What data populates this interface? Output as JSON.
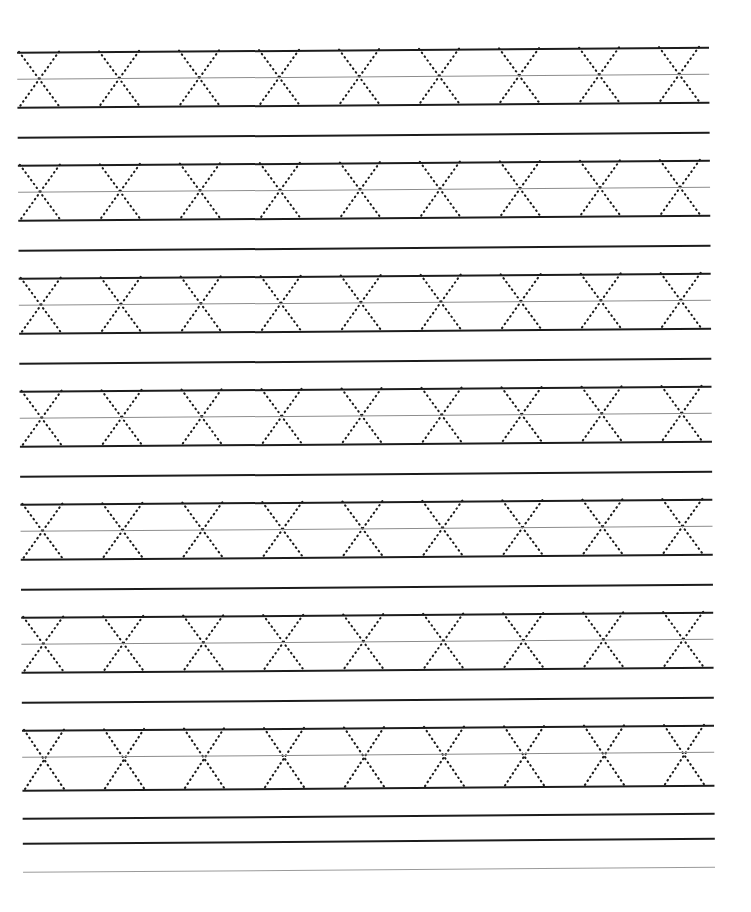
{
  "document": {
    "kind": "handwriting-practice-worksheet",
    "title": "Letter X Tracing Practice Worksheet",
    "paper_width": 751,
    "paper_height": 912,
    "background_color": "#ffffff",
    "orientation": "portrait",
    "scan_rotation_degrees": -0.42,
    "header_text": "",
    "footer_text": ""
  },
  "ruling": {
    "content_left": 20,
    "content_right": 712,
    "top_margin": 52,
    "row_pitch": 113,
    "band_height": 55,
    "top_line_color": "#1c1c1c",
    "mid_line_color": "#8d8d8d",
    "bottom_line_color": "#1c1c1c",
    "baseline_color": "#1c1c1c",
    "top_line_width": 2,
    "mid_line_width": 1,
    "bottom_line_width": 2,
    "baseline_width": 2
  },
  "glyph": {
    "character": "X",
    "style": "dotted-trace-guide",
    "stroke_color": "#1a1a1a",
    "stroke_width": 2.1,
    "dash_pattern": "0.6 4.1",
    "glyph_width": 40,
    "glyph_height": 55,
    "advance": 80,
    "first_center_x": 42,
    "strokes": [
      "down-right-diagonal",
      "down-left-diagonal"
    ]
  },
  "rows": [
    {
      "index": 1,
      "label": "practice-row-1",
      "top_y": 52,
      "mid_y": 79,
      "bottom_y": 107,
      "baseline_y": 137,
      "glyph_count": 9,
      "glyph_char": "X"
    },
    {
      "index": 2,
      "label": "practice-row-2",
      "top_y": 165,
      "mid_y": 192,
      "bottom_y": 220,
      "baseline_y": 250,
      "glyph_count": 9,
      "glyph_char": "X"
    },
    {
      "index": 3,
      "label": "practice-row-3",
      "top_y": 278,
      "mid_y": 305,
      "bottom_y": 333,
      "baseline_y": 363,
      "glyph_count": 9,
      "glyph_char": "X"
    },
    {
      "index": 4,
      "label": "practice-row-4",
      "top_y": 391,
      "mid_y": 418,
      "bottom_y": 446,
      "baseline_y": 476,
      "glyph_count": 9,
      "glyph_char": "X"
    },
    {
      "index": 5,
      "label": "practice-row-5",
      "top_y": 504,
      "mid_y": 531,
      "bottom_y": 559,
      "baseline_y": 589,
      "glyph_count": 9,
      "glyph_char": "X"
    },
    {
      "index": 6,
      "label": "practice-row-6",
      "top_y": 617,
      "mid_y": 644,
      "bottom_y": 672,
      "baseline_y": 702,
      "glyph_count": 9,
      "glyph_char": "X"
    },
    {
      "index": 7,
      "label": "practice-row-7",
      "top_y": 730,
      "mid_y": 757,
      "bottom_y": 790,
      "baseline_y": 818,
      "glyph_count": 9,
      "glyph_char": "X"
    }
  ],
  "trailing_lines": [
    {
      "index": 1,
      "label": "trailing-line-1",
      "y": 843,
      "color": "#1c1c1c",
      "weight": 2,
      "style": "solid"
    },
    {
      "index": 2,
      "label": "trailing-line-2",
      "y": 872,
      "color": "#9a9a9a",
      "weight": 1,
      "style": "light"
    }
  ],
  "summary": {
    "total_practice_rows": 7,
    "glyphs_per_row": 9,
    "total_glyphs": 63,
    "total_ruled_lines": 30
  }
}
